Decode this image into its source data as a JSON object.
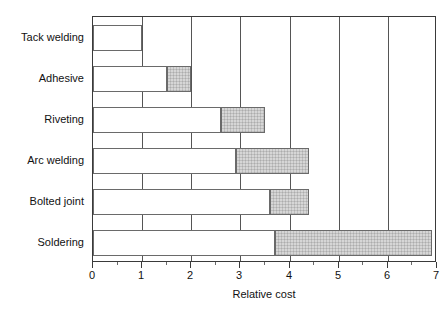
{
  "chart_data": {
    "type": "bar",
    "orientation": "horizontal",
    "title": "",
    "xlabel": "Relative cost",
    "ylabel": "",
    "xlim": [
      0,
      7
    ],
    "xticks": [
      0,
      1,
      2,
      3,
      4,
      5,
      6,
      7
    ],
    "xtick_labels": [
      "0",
      "1",
      "2",
      "3",
      "4",
      "5",
      "6",
      "7"
    ],
    "minor_tick_step": 0.5,
    "grid": "vertical-major",
    "legend": null,
    "categories": [
      "Tack welding",
      "Adhesive",
      "Riveting",
      "Arc welding",
      "Bolted joint",
      "Soldering"
    ],
    "series": [
      {
        "name": "low",
        "style": "white",
        "values": [
          1.0,
          1.5,
          2.6,
          2.9,
          3.6,
          3.7
        ]
      },
      {
        "name": "high",
        "style": "shaded",
        "values": [
          1.0,
          2.0,
          3.5,
          4.4,
          4.4,
          6.9
        ]
      }
    ],
    "bars": [
      {
        "category": "Tack welding",
        "low": 1.0,
        "high": 1.0,
        "range": "1.0"
      },
      {
        "category": "Adhesive",
        "low": 1.5,
        "high": 2.0,
        "range": "1.5-2.0"
      },
      {
        "category": "Riveting",
        "low": 2.6,
        "high": 3.5,
        "range": "2.6-3.5"
      },
      {
        "category": "Arc welding",
        "low": 2.9,
        "high": 4.4,
        "range": "2.9-4.4"
      },
      {
        "category": "Bolted joint",
        "low": 3.6,
        "high": 4.4,
        "range": "3.6-4.4"
      },
      {
        "category": "Soldering",
        "low": 3.7,
        "high": 6.9,
        "range": "3.7-6.9"
      }
    ],
    "colors": {
      "bar_fill_low": "#ffffff",
      "bar_fill_high": "#bfbfbf",
      "bar_border": "#6a6a6a",
      "axis": "#3a3a3a",
      "grid": "#555555",
      "text": "#111111",
      "background": "#ffffff"
    }
  }
}
